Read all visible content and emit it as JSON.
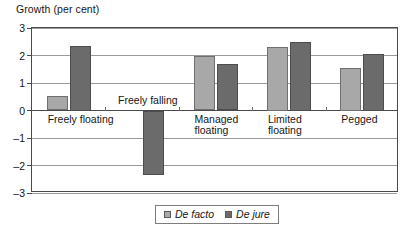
{
  "chart_data": {
    "type": "bar",
    "title": "Growth (per cent)",
    "ylabel": "Growth (per cent)",
    "xlabel": "",
    "categories": [
      "Freely floating",
      "Freely falling",
      "Managed floating",
      "Limited floating",
      "Pegged"
    ],
    "category_lines": [
      [
        "Freely floating"
      ],
      [
        "Freely falling"
      ],
      [
        "Managed",
        "floating"
      ],
      [
        "Limited",
        "floating"
      ],
      [
        "Pegged"
      ]
    ],
    "series": [
      {
        "name": "De facto",
        "color": "#a8a8a8",
        "values": [
          0.52,
          null,
          1.97,
          2.3,
          1.55
        ]
      },
      {
        "name": "De jure",
        "color": "#6b6b6b",
        "values": [
          2.35,
          -2.35,
          1.68,
          2.5,
          2.05
        ]
      }
    ],
    "ylim": [
      -3,
      3
    ],
    "yticks": [
      3,
      2,
      1,
      0,
      -1,
      -2,
      -3
    ],
    "ytick_labels": [
      "3",
      "2",
      "1",
      "0",
      "–1",
      "–2",
      "–3"
    ],
    "grid": true,
    "legend_position": "bottom"
  },
  "legend": {
    "entries": [
      {
        "label": "De facto"
      },
      {
        "label": "De jure"
      }
    ]
  },
  "colors": {
    "de_facto": "#a8a8a8",
    "de_jure": "#6b6b6b",
    "frame": "#4a4a4a",
    "grid": "#9a9a9a"
  }
}
